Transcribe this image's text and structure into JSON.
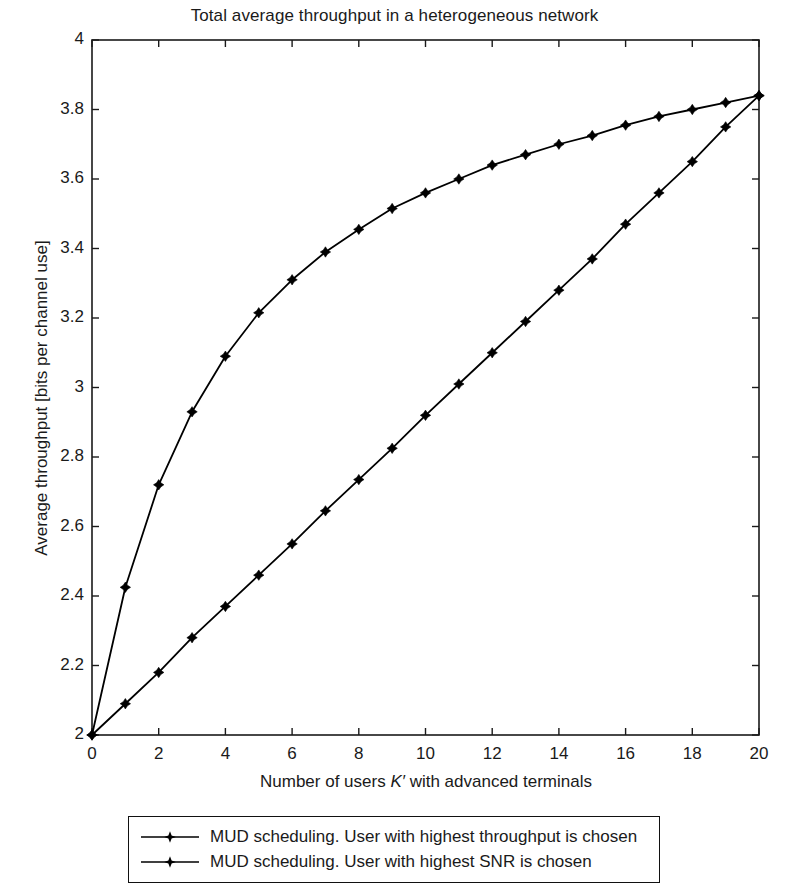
{
  "chart_data": {
    "type": "line",
    "title": "Total average throughput in a heterogeneous network",
    "xlabel_parts": {
      "before": "Number of users ",
      "symbol": "K′",
      "after": " with advanced terminals"
    },
    "xlabel": "Number of users K′ with advanced terminals",
    "ylabel": "Average throughput [bits per channel use]",
    "xlim": [
      0,
      20
    ],
    "ylim": [
      2,
      4
    ],
    "xticks": [
      0,
      2,
      4,
      6,
      8,
      10,
      12,
      14,
      16,
      18,
      20
    ],
    "xtick_labels": [
      "0",
      "2",
      "4",
      "6",
      "8",
      "10",
      "12",
      "14",
      "16",
      "18",
      "20"
    ],
    "yticks": [
      2,
      2.2,
      2.4,
      2.6,
      2.8,
      3,
      3.2,
      3.4,
      3.6,
      3.8,
      4
    ],
    "ytick_labels": [
      "2",
      "2.2",
      "2.4",
      "2.6",
      "2.8",
      "3",
      "3.2",
      "3.4",
      "3.6",
      "3.8",
      "4"
    ],
    "x": [
      0,
      1,
      2,
      3,
      4,
      5,
      6,
      7,
      8,
      9,
      10,
      11,
      12,
      13,
      14,
      15,
      16,
      17,
      18,
      19,
      20
    ],
    "grid": false,
    "legend_position": "below-axes",
    "line_color": "#000000",
    "marker": "diamond-star",
    "series": [
      {
        "name": "MUD scheduling. User with highest throughput is chosen",
        "values": [
          2.0,
          2.425,
          2.72,
          2.93,
          3.09,
          3.215,
          3.31,
          3.39,
          3.455,
          3.515,
          3.56,
          3.6,
          3.64,
          3.67,
          3.7,
          3.725,
          3.755,
          3.78,
          3.8,
          3.82,
          3.84
        ]
      },
      {
        "name": "MUD scheduling. User with highest SNR is chosen",
        "values": [
          2.0,
          2.09,
          2.18,
          2.28,
          2.37,
          2.46,
          2.55,
          2.645,
          2.735,
          2.825,
          2.92,
          3.01,
          3.1,
          3.19,
          3.28,
          3.37,
          3.47,
          3.56,
          3.65,
          3.75,
          3.84
        ]
      }
    ]
  },
  "legend": {
    "entries": [
      {
        "label": "MUD scheduling. User with highest throughput is chosen"
      },
      {
        "label": "MUD scheduling. User with highest SNR is chosen"
      }
    ]
  }
}
